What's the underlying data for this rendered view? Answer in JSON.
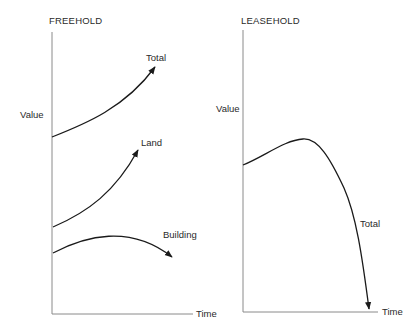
{
  "diagram": {
    "freehold": {
      "title": "FREEHOLD",
      "y_label": "Value",
      "x_label": "Time",
      "curves": [
        {
          "name": "total",
          "label": "Total",
          "trend": "rising, accelerating"
        },
        {
          "name": "land",
          "label": "Land",
          "trend": "rising, accelerating"
        },
        {
          "name": "building",
          "label": "Building",
          "trend": "rises slightly then declines"
        }
      ]
    },
    "leasehold": {
      "title": "LEASEHOLD",
      "y_label": "Value",
      "x_label": "Time",
      "curves": [
        {
          "name": "total",
          "label": "Total",
          "trend": "rises gently, peaks, then falls steeply to zero"
        }
      ]
    },
    "colors": {
      "curve": "#1a1a1a",
      "axis": "#8a8a8a",
      "text": "#2a2a2a",
      "background": "#ffffff"
    }
  }
}
